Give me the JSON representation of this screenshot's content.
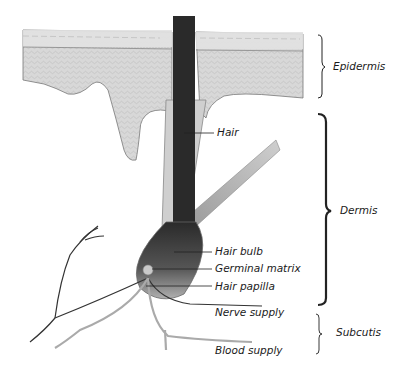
{
  "figure": {
    "layers": [
      {
        "name": "Epidermis",
        "brace_top": 35,
        "brace_bottom": 98
      },
      {
        "name": "Dermis",
        "brace_top": 114,
        "brace_bottom": 305
      },
      {
        "name": "Subcutis",
        "brace_top": 314,
        "brace_bottom": 354
      }
    ],
    "structure_labels": [
      {
        "name": "Hair"
      },
      {
        "name": "Hair bulb"
      },
      {
        "name": "Germinal matrix"
      },
      {
        "name": "Hair papilla"
      },
      {
        "name": "Nerve supply"
      },
      {
        "name": "Blood supply"
      }
    ]
  },
  "colors": {
    "background": "#ffffff",
    "skin_fill": "#d4d4d4",
    "hair_fill": "#2a2a2a",
    "text": "#1a1a1a"
  }
}
